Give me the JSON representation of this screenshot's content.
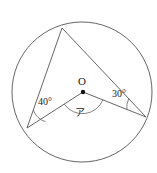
{
  "figure": {
    "type": "circle-inscribed-angle-diagram",
    "background_color": "#ffffff",
    "stroke_color": "#555555",
    "text_color": "#222222"
  },
  "circle": {
    "center_label": "O",
    "center_x": 82,
    "center_y": 92,
    "radius": 70
  },
  "points": {
    "top": {
      "name": "A",
      "x": 62,
      "y": 28
    },
    "left": {
      "name": "B",
      "x": 27,
      "y": 128
    },
    "right": {
      "name": "C",
      "x": 146,
      "y": 117
    },
    "center": {
      "name": "O",
      "x": 83,
      "y": 92
    }
  },
  "labels": {
    "center": "O",
    "angle_left": "40°",
    "angle_right": "30°",
    "angle_unknown": "ア"
  },
  "label_positions": {
    "center": {
      "x": 82,
      "y": 85
    },
    "angle_left": {
      "x": 38,
      "y": 105
    },
    "angle_right": {
      "x": 112,
      "y": 97
    },
    "angle_unknown": {
      "x": 80,
      "y": 116
    }
  },
  "segments": [
    {
      "name": "chord-left-top",
      "from": "left",
      "to": "top"
    },
    {
      "name": "chord-top-right",
      "from": "top",
      "to": "right"
    },
    {
      "name": "radius-center-left",
      "from": "center",
      "to": "left"
    },
    {
      "name": "radius-center-right",
      "from": "center",
      "to": "right"
    }
  ],
  "angle_arcs": [
    {
      "name": "arc-left-40",
      "at": "left",
      "value": "40°"
    },
    {
      "name": "arc-right-30",
      "at": "right",
      "value": "30°"
    },
    {
      "name": "arc-center-unknown",
      "at": "center",
      "value": "ア"
    }
  ]
}
